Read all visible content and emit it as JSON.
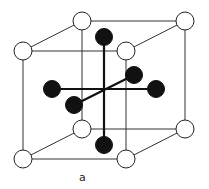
{
  "diagram": {
    "label": "a",
    "colors": {
      "edge": "#333333",
      "black_atom": "#111111",
      "white_atom": "#ffffff"
    }
  }
}
